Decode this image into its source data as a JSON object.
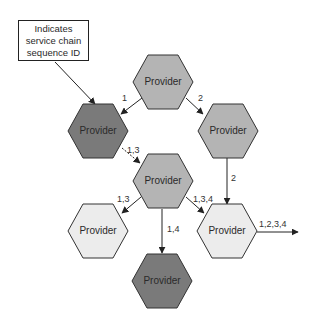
{
  "colors": {
    "dark": "#7a7a7a",
    "medium": "#b4b4b4",
    "light": "#ececec",
    "stroke": "#333333",
    "arrow": "#222222"
  },
  "callout": {
    "lines": [
      "Indicates",
      "service chain",
      "sequence ID"
    ]
  },
  "nodes": [
    {
      "id": "top",
      "label": "Provider",
      "shade": "medium",
      "cx": 163,
      "cy": 82
    },
    {
      "id": "left",
      "label": "Provider",
      "shade": "dark",
      "cx": 98,
      "cy": 131
    },
    {
      "id": "right",
      "label": "Provider",
      "shade": "medium",
      "cx": 228,
      "cy": 131
    },
    {
      "id": "center",
      "label": "Provider",
      "shade": "medium",
      "cx": 163,
      "cy": 181
    },
    {
      "id": "bottom-left",
      "label": "Provider",
      "shade": "light",
      "cx": 98,
      "cy": 231
    },
    {
      "id": "bottom-right",
      "label": "Provider",
      "shade": "light",
      "cx": 227,
      "cy": 231
    },
    {
      "id": "bottom",
      "label": "Provider",
      "shade": "dark",
      "cx": 162,
      "cy": 281
    }
  ],
  "edges": [
    {
      "from": "top",
      "to": "left",
      "label": "1"
    },
    {
      "from": "top",
      "to": "right",
      "label": "2"
    },
    {
      "from": "left",
      "to": "center",
      "label": "1,3"
    },
    {
      "from": "right",
      "to": "bottom-right",
      "label": "2"
    },
    {
      "from": "center",
      "to": "bottom-left",
      "label": "1,3"
    },
    {
      "from": "center",
      "to": "bottom-right",
      "label": "1,3,4"
    },
    {
      "from": "center",
      "to": "bottom",
      "label": "1,4"
    },
    {
      "from": "bottom-right",
      "to": "output",
      "label": "1,2,3,4"
    }
  ]
}
